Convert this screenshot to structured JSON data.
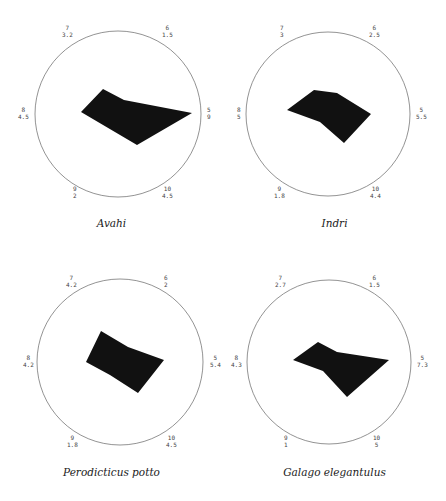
{
  "chart_data": [
    {
      "type": "radar",
      "title": "Avahi",
      "axes": [
        {
          "id": "5",
          "value": 9,
          "label": "9"
        },
        {
          "id": "6",
          "value": 1.5,
          "label": "1.5"
        },
        {
          "id": "7",
          "value": 3.2,
          "label": "3.2"
        },
        {
          "id": "8",
          "value": 4.5,
          "label": "4.5"
        },
        {
          "id": "9",
          "value": 2,
          "label": "2"
        },
        {
          "id": "10",
          "value": 4.5,
          "label": "4.5"
        }
      ],
      "fill": "#111111"
    },
    {
      "type": "radar",
      "title": "Indri",
      "axes": [
        {
          "id": "5",
          "value": 5.5,
          "label": "5.5"
        },
        {
          "id": "6",
          "value": 2.5,
          "label": "2.5"
        },
        {
          "id": "7",
          "value": 3,
          "label": "3"
        },
        {
          "id": "8",
          "value": 5,
          "label": "5"
        },
        {
          "id": "9",
          "value": 1.8,
          "label": "1.8"
        },
        {
          "id": "10",
          "value": 4.4,
          "label": "4.4"
        }
      ],
      "fill": "#111111"
    },
    {
      "type": "radar",
      "title": "Perodicticus potto",
      "axes": [
        {
          "id": "5",
          "value": 5.4,
          "label": "5.4"
        },
        {
          "id": "6",
          "value": 2,
          "label": "2"
        },
        {
          "id": "7",
          "value": 4.2,
          "label": "4.2"
        },
        {
          "id": "8",
          "value": 4.2,
          "label": "4.2"
        },
        {
          "id": "9",
          "value": 1.8,
          "label": "1.8"
        },
        {
          "id": "10",
          "value": 4.5,
          "label": "4.5"
        }
      ],
      "fill": "#111111"
    },
    {
      "type": "radar",
      "title": "Galago elegantulus",
      "axes": [
        {
          "id": "5",
          "value": 7.3,
          "label": "7.3"
        },
        {
          "id": "6",
          "value": 1.5,
          "label": "1.5"
        },
        {
          "id": "7",
          "value": 2.7,
          "label": "2.7"
        },
        {
          "id": "8",
          "value": 4.3,
          "label": "4.3"
        },
        {
          "id": "9",
          "value": 1,
          "label": "1"
        },
        {
          "id": "10",
          "value": 5,
          "label": "5"
        }
      ],
      "fill": "#111111"
    }
  ],
  "panels": [
    {
      "caption": "Avahi",
      "labels": {
        "a7": "7\n3.2",
        "a6": "6\n1.5",
        "a8": "8\n4.5",
        "a5": "5\n9",
        "a9": "9\n2",
        "a10": "10\n4.5"
      },
      "polygon": "81,112 103,89 124,100 192,113 137,145"
    },
    {
      "caption": "Indri",
      "labels": {
        "a7": "7\n3",
        "a6": "6\n2.5",
        "a8": "8\n5",
        "a5": "5\n5.5",
        "a9": "9\n1.8",
        "a10": "10\n4.4"
      },
      "polygon": "64,110 91,90 114,93 148,114 121,143 97,122"
    },
    {
      "caption": "Perodicticus potto",
      "labels": {
        "a7": "7\n4.2",
        "a6": "6\n2",
        "a8": "8\n4.2",
        "a5": "5\n5.4",
        "a9": "9\n1.8",
        "a10": "10\n4.5"
      },
      "polygon": "101,81 128,97 164,110 138,143 110,125 86,112"
    },
    {
      "caption": "Galago elegantulus",
      "labels": {
        "a7": "7\n2.7",
        "a6": "6\n1.5",
        "a8": "8\n4.3",
        "a5": "5\n7.3",
        "a9": "9\n1",
        "a10": "10\n5"
      },
      "polygon": "70,110 95,92 114,102 166,110 124,147 100,121"
    }
  ]
}
